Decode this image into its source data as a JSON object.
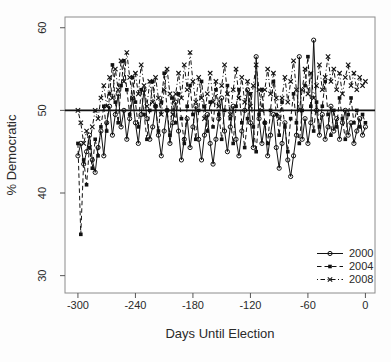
{
  "figure": {
    "background": "#fdfdfd",
    "frame_color": "#8c8c8c",
    "ink_color": "#111111",
    "text_color": "#2a2a2a"
  },
  "chart_data": {
    "type": "line",
    "title": "",
    "xlabel": "Days Until Election",
    "ylabel": "% Democratic",
    "xlim": [
      -313.5,
      10
    ],
    "ylim": [
      27.9,
      61.3
    ],
    "xticks": [
      -300,
      -240,
      -180,
      -120,
      -60,
      0
    ],
    "yticks": [
      30,
      40,
      50,
      60
    ],
    "grid": false,
    "reference_line_y": 50,
    "legend_position": "bottom-right",
    "x": [
      -300,
      -297,
      -294,
      -291,
      -288,
      -285,
      -282,
      -279,
      -276,
      -273,
      -270,
      -267,
      -264,
      -261,
      -258,
      -255,
      -252,
      -249,
      -246,
      -243,
      -240,
      -237,
      -234,
      -231,
      -228,
      -225,
      -222,
      -219,
      -216,
      -213,
      -210,
      -207,
      -204,
      -201,
      -198,
      -195,
      -192,
      -189,
      -186,
      -183,
      -180,
      -177,
      -174,
      -171,
      -168,
      -165,
      -162,
      -159,
      -156,
      -153,
      -150,
      -147,
      -144,
      -141,
      -138,
      -135,
      -132,
      -129,
      -126,
      -123,
      -120,
      -117,
      -114,
      -111,
      -108,
      -105,
      -102,
      -99,
      -96,
      -93,
      -90,
      -87,
      -84,
      -81,
      -78,
      -75,
      -72,
      -69,
      -66,
      -63,
      -60,
      -57,
      -54,
      -51,
      -48,
      -45,
      -42,
      -39,
      -36,
      -33,
      -30,
      -27,
      -24,
      -21,
      -18,
      -15,
      -12,
      -9,
      -6,
      -3,
      0
    ],
    "series": [
      {
        "name": "2000",
        "marker": "open-circle",
        "line": "solid",
        "values": [
          44.5,
          46.0,
          43.5,
          45.0,
          47.0,
          44.0,
          42.5,
          45.5,
          47.5,
          44.5,
          48.5,
          50.5,
          47.0,
          49.5,
          52.0,
          48.0,
          50.0,
          46.5,
          49.0,
          51.5,
          48.5,
          46.0,
          49.5,
          52.5,
          49.0,
          46.5,
          48.0,
          50.5,
          47.0,
          44.5,
          47.5,
          50.0,
          46.0,
          48.5,
          51.0,
          47.5,
          44.0,
          46.5,
          49.0,
          45.5,
          48.0,
          50.5,
          46.5,
          44.0,
          47.0,
          49.5,
          46.0,
          43.5,
          46.5,
          49.0,
          51.5,
          47.5,
          45.0,
          48.0,
          50.5,
          46.5,
          44.5,
          47.5,
          50.0,
          52.5,
          48.5,
          45.5,
          56.5,
          49.0,
          46.0,
          48.5,
          44.5,
          47.0,
          49.5,
          45.5,
          43.0,
          46.0,
          48.5,
          44.0,
          42.0,
          44.5,
          47.0,
          56.5,
          46.5,
          49.0,
          46.0,
          48.5,
          58.5,
          50.0,
          47.0,
          49.5,
          46.5,
          48.0,
          50.5,
          47.5,
          49.0,
          46.5,
          48.5,
          50.0,
          47.0,
          48.5,
          46.0,
          47.5,
          49.0,
          47.0,
          48.0
        ]
      },
      {
        "name": "2004",
        "marker": "filled-square",
        "line": "dashed",
        "values": [
          46.0,
          35.0,
          44.0,
          41.0,
          45.5,
          43.0,
          46.5,
          44.5,
          48.0,
          50.5,
          47.5,
          52.0,
          55.5,
          51.0,
          48.5,
          53.0,
          56.0,
          52.5,
          49.5,
          54.0,
          51.0,
          48.0,
          52.5,
          49.5,
          46.5,
          50.0,
          53.5,
          50.5,
          47.5,
          51.0,
          54.5,
          50.0,
          47.0,
          51.5,
          48.5,
          52.0,
          49.0,
          46.0,
          50.5,
          53.0,
          49.5,
          46.5,
          50.0,
          53.5,
          50.5,
          47.5,
          51.0,
          48.0,
          52.5,
          49.5,
          46.5,
          50.0,
          53.0,
          49.0,
          46.0,
          50.5,
          52.5,
          48.5,
          45.5,
          49.0,
          52.0,
          48.0,
          45.0,
          49.5,
          52.5,
          48.5,
          46.0,
          50.0,
          53.5,
          49.5,
          47.0,
          51.0,
          48.0,
          45.0,
          49.0,
          52.0,
          48.5,
          46.0,
          50.0,
          53.0,
          56.5,
          50.5,
          47.5,
          51.0,
          48.0,
          50.5,
          53.5,
          49.5,
          47.0,
          50.0,
          48.0,
          51.5,
          49.0,
          46.5,
          49.5,
          51.5,
          48.5,
          50.0,
          48.0,
          49.5,
          48.5
        ]
      },
      {
        "name": "2008",
        "marker": "x-cross",
        "line": "dotdash",
        "values": [
          50.0,
          48.5,
          46.0,
          47.5,
          45.5,
          48.0,
          50.0,
          49.0,
          51.5,
          53.0,
          50.5,
          54.0,
          51.5,
          55.0,
          52.5,
          56.0,
          53.5,
          57.0,
          54.0,
          51.5,
          54.5,
          52.0,
          55.5,
          53.0,
          50.5,
          53.5,
          51.0,
          54.0,
          51.5,
          49.5,
          52.5,
          55.0,
          52.0,
          49.5,
          52.0,
          54.5,
          51.5,
          55.5,
          52.5,
          57.0,
          53.5,
          51.0,
          54.0,
          51.5,
          49.0,
          52.0,
          54.5,
          51.0,
          53.5,
          50.5,
          53.0,
          55.5,
          52.0,
          49.5,
          52.5,
          55.0,
          51.5,
          54.0,
          51.0,
          53.5,
          50.5,
          53.0,
          55.5,
          52.5,
          50.0,
          52.5,
          55.0,
          52.0,
          54.5,
          51.5,
          49.0,
          51.5,
          54.0,
          51.0,
          53.5,
          56.0,
          52.5,
          50.0,
          52.5,
          55.0,
          52.0,
          54.5,
          51.5,
          53.0,
          55.5,
          52.5,
          54.0,
          56.5,
          53.5,
          55.0,
          52.5,
          54.5,
          52.0,
          54.0,
          55.5,
          53.0,
          54.5,
          52.5,
          54.0,
          53.0,
          53.5
        ]
      }
    ]
  }
}
